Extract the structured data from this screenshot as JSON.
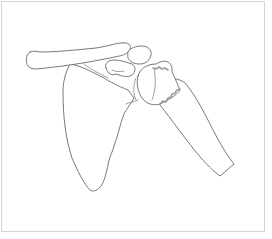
{
  "figure": {
    "structures": [
      "clavicle",
      "scapula",
      "acromion",
      "coracoid-process",
      "humeral-head",
      "humerus-shaft",
      "fracture-line"
    ],
    "colors": {
      "line": "#6a6a6a",
      "fracture": "#9a9a9a",
      "frame": "#d4d4d4",
      "background": "#ffffff"
    }
  }
}
